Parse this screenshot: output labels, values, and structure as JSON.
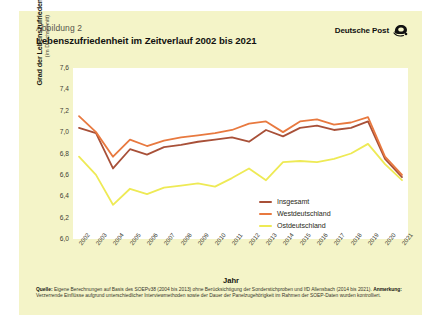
{
  "figure_number": "Abbildung 2",
  "title": "Lebenszufriedenheit im Zeitverlauf 2002 bis 2021",
  "brand": {
    "name": "Deutsche Post",
    "logo_icon": "posthorn-icon"
  },
  "axis": {
    "y_title_line1": "Grad der Lebenszufriedenheit",
    "y_title_line2": "(im Durchschnitt)",
    "x_title": "Jahr",
    "y_ticks": [
      "7,6",
      "7,4",
      "7,2",
      "7,0",
      "6,8",
      "6,6",
      "6,4",
      "6,2",
      "6,0"
    ]
  },
  "note": {
    "source_label": "Quelle:",
    "source_text": "Eigene Berechnungen auf Basis des SOEPv38 (2004 bis 2013) ohne Berücksichtigung der Sonderstichproben und IfD Allensbach (2014 bis 2021).",
    "remark_label": "Anmerkung:",
    "remark_text": "Verzerrende Einflüsse aufgrund unterschiedlicher Interviewmethoden sowie der Dauer der Panelzugehörigkeit im Rahmen der SOEP-Daten wurden kontrolliert."
  },
  "colors": {
    "card_bg": "#f4f4c8",
    "plot_bg": "#ffffff",
    "insgesamt": "#a85038",
    "westdeutschland": "#e8793f",
    "ostdeutschland": "#eeea55"
  },
  "chart_data": {
    "type": "line",
    "title": "Lebenszufriedenheit im Zeitverlauf 2002 bis 2021",
    "xlabel": "Jahr",
    "ylabel": "Grad der Lebenszufriedenheit (im Durchschnitt)",
    "ylim": [
      6.0,
      7.6
    ],
    "ytick_step": 0.2,
    "grid": false,
    "legend_position": "inside-bottom-right",
    "categories": [
      "2002",
      "2003",
      "2004",
      "2005",
      "2006",
      "2007",
      "2008",
      "2009",
      "2010",
      "2011",
      "2012",
      "2013",
      "2014",
      "2015",
      "2016",
      "2017",
      "2018",
      "2019",
      "2020",
      "2021"
    ],
    "series": [
      {
        "name": "Insgesamt",
        "color": "#a85038",
        "values": [
          7.04,
          6.99,
          6.66,
          6.84,
          6.79,
          6.86,
          6.88,
          6.91,
          6.93,
          6.95,
          6.91,
          7.02,
          6.96,
          7.04,
          7.06,
          7.02,
          7.04,
          7.1,
          6.75,
          6.58
        ]
      },
      {
        "name": "Westdeutschland",
        "color": "#e8793f",
        "values": [
          7.15,
          7.0,
          6.77,
          6.93,
          6.87,
          6.92,
          6.95,
          6.97,
          6.99,
          7.02,
          7.08,
          7.1,
          7.0,
          7.1,
          7.12,
          7.07,
          7.09,
          7.14,
          6.77,
          6.6
        ]
      },
      {
        "name": "Ostdeutschland",
        "color": "#eeea55",
        "values": [
          6.77,
          6.6,
          6.32,
          6.47,
          6.42,
          6.48,
          6.5,
          6.52,
          6.49,
          6.57,
          6.66,
          6.55,
          6.72,
          6.73,
          6.72,
          6.75,
          6.8,
          6.89,
          6.7,
          6.55
        ]
      }
    ]
  }
}
